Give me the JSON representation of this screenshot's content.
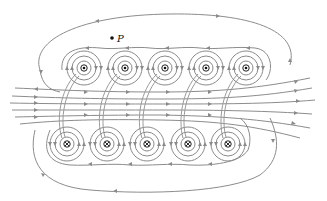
{
  "figure": {
    "point_label": "P",
    "point": {
      "x": 112,
      "y": 38
    },
    "colors": {
      "field_line": "#8c8c8c",
      "conductor": "#111111",
      "background": "#ffffff"
    },
    "top_row": {
      "current_direction": "out-of-page",
      "symbol": "dot",
      "y": 68,
      "x": [
        84,
        125,
        165,
        206,
        246
      ]
    },
    "bottom_row": {
      "current_direction": "into-page",
      "symbol": "cross",
      "y": 144,
      "x": [
        67,
        107,
        147,
        188,
        228
      ]
    },
    "interior_field_direction": "left-to-right",
    "outer_loop_direction": "counterclockwise on top, clockwise on bottom"
  }
}
